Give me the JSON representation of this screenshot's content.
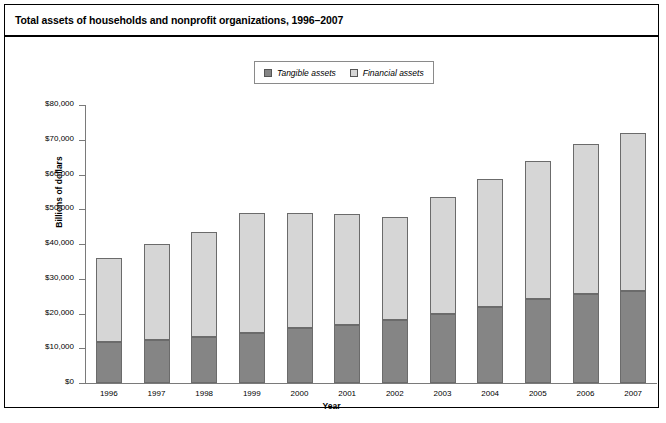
{
  "figure": {
    "title": "Total assets of households and nonprofit organizations, 1996–2007",
    "footnote": ""
  },
  "legend": {
    "position": "top-center",
    "entries": [
      {
        "label": "Tangible assets",
        "color": "#858585",
        "key": "tangible"
      },
      {
        "label": "Financial assets",
        "color": "#d6d6d6",
        "key": "financial"
      }
    ]
  },
  "axes": {
    "y": {
      "label": "Billions of dollars",
      "ticks": [
        "$0",
        "$10,000",
        "$20,000",
        "$30,000",
        "$40,000",
        "$50,000",
        "$60,000",
        "$70,000",
        "$80,000"
      ],
      "min": 0,
      "max": 80000,
      "step": 10000
    },
    "x": {
      "label": "Year",
      "ticks": [
        "1996",
        "1997",
        "1998",
        "1999",
        "2000",
        "2001",
        "2002",
        "2003",
        "2004",
        "2005",
        "2006",
        "2007"
      ]
    }
  },
  "chart_data": {
    "type": "bar",
    "stacked": true,
    "title": "Total assets of households and nonprofit organizations, 1996–2007",
    "xlabel": "Year",
    "ylabel": "Billions of dollars",
    "ylim": [
      0,
      80000
    ],
    "ytick_step": 10000,
    "grid": false,
    "legend_position": "top-center",
    "categories": [
      "1996",
      "1997",
      "1998",
      "1999",
      "2000",
      "2001",
      "2002",
      "2003",
      "2004",
      "2005",
      "2006",
      "2007"
    ],
    "series": [
      {
        "name": "Tangible assets",
        "color": "#858585",
        "values": [
          11800,
          12400,
          13200,
          14400,
          15800,
          16800,
          18200,
          20000,
          21800,
          24200,
          25600,
          26400
        ]
      },
      {
        "name": "Financial assets",
        "color": "#d6d6d6",
        "values": [
          24100,
          27500,
          30400,
          34600,
          33200,
          31900,
          29600,
          33600,
          37000,
          39600,
          43200,
          45500
        ]
      }
    ],
    "totals": [
      35900,
      39900,
      43600,
      49000,
      49000,
      48700,
      47800,
      53600,
      58800,
      63800,
      68800,
      71900
    ]
  }
}
